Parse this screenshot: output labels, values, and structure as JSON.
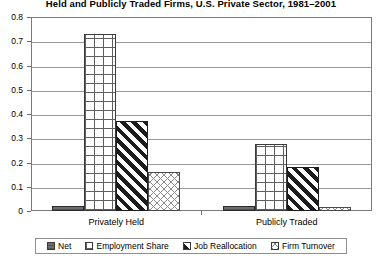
{
  "chart_data": {
    "type": "bar",
    "title": "Held and Publicly Traded Firms, U.S. Private Sector, 1981–2001",
    "xlabel": "",
    "ylabel": "",
    "ylim": [
      0,
      0.8
    ],
    "ytick_labels": [
      "0.8",
      "0.7",
      "0.6",
      "0.5",
      "0.4",
      "0.3",
      "0.2",
      "0.1",
      "0"
    ],
    "ytick_values": [
      0.8,
      0.7,
      0.6,
      0.5,
      0.4,
      0.3,
      0.2,
      0.1,
      0
    ],
    "grid": true,
    "legend_position": "bottom",
    "categories": [
      "Privately Held",
      "Publicly Traded"
    ],
    "series": [
      {
        "name": "Net",
        "values": [
          0.02,
          0.02
        ],
        "swatch": "solid-dark-grey"
      },
      {
        "name": "Employment Share",
        "values": [
          0.73,
          0.275
        ],
        "swatch": "open-grid"
      },
      {
        "name": "Job Reallocation",
        "values": [
          0.37,
          0.18
        ],
        "swatch": "diagonal-hatch"
      },
      {
        "name": "Firm Turnover",
        "values": [
          0.16,
          0.015
        ],
        "swatch": "fine-crosshatch"
      }
    ]
  },
  "colors": {
    "plot_border": "#7a7a7a",
    "gridline": "#9a9a9a",
    "bar_outline": "#3a3a3a",
    "net_fill": "#6d6d6d",
    "job_hatch": "#1c1c1c",
    "background": "#ffffff"
  }
}
